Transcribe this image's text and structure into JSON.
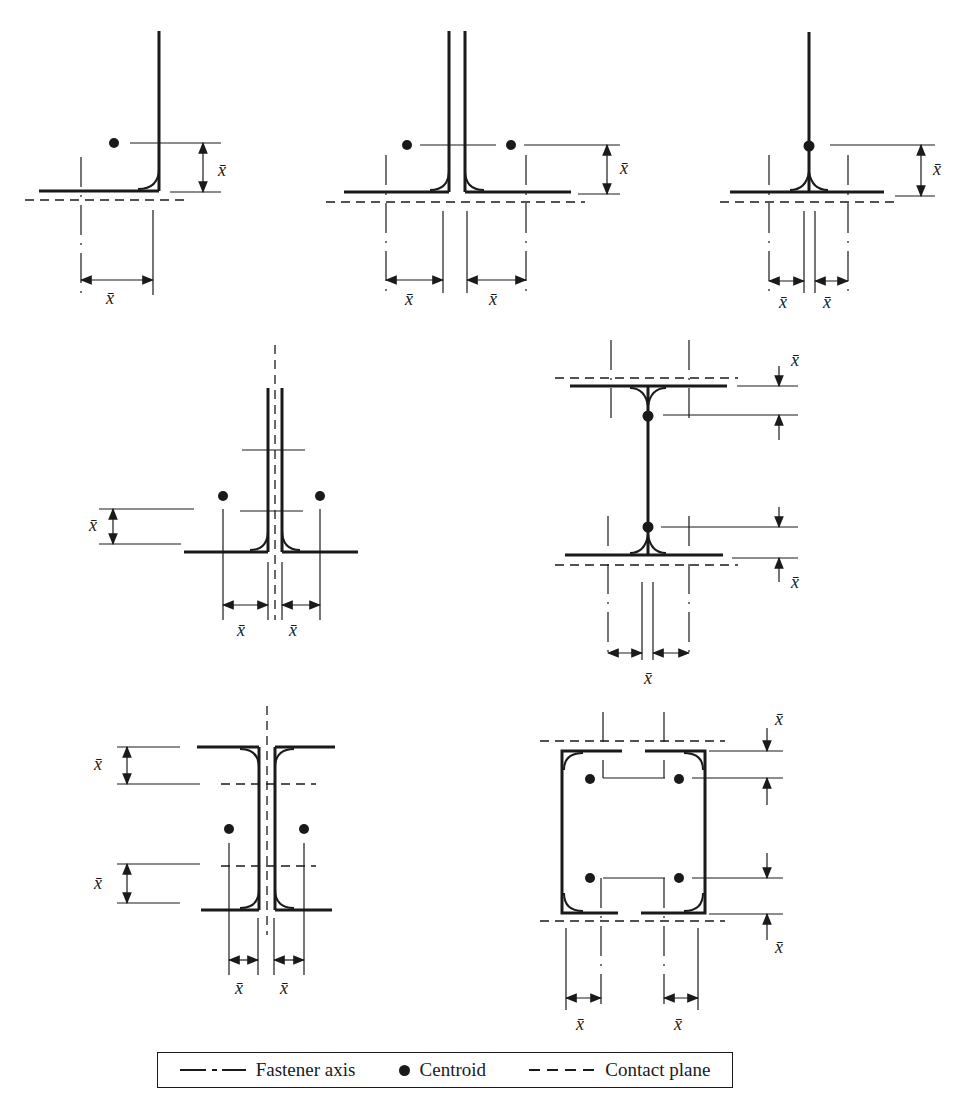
{
  "figure": {
    "dimension_label": "x̄",
    "panels": [
      {
        "id": "single-angle",
        "description": "Single angle, one centroid"
      },
      {
        "id": "double-angle-back-to-back",
        "description": "Two angles back-to-back, two centroids"
      },
      {
        "id": "tee-section",
        "description": "Tee section, centroid on stem"
      },
      {
        "id": "double-angle-separated",
        "description": "Two angles separated by gap with fastener axis"
      },
      {
        "id": "wide-flange",
        "description": "I-section, two centroids on web"
      },
      {
        "id": "back-to-back-channels",
        "description": "Two channels back-to-back with fastener axis"
      },
      {
        "id": "box-channels",
        "description": "Two channels forming box, four centroids"
      }
    ]
  },
  "legend": {
    "fastener_axis": "Fastener axis",
    "centroid": "Centroid",
    "contact_plane": "Contact plane"
  },
  "colors": {
    "ink": "#1a1a1a",
    "background": "#ffffff"
  }
}
